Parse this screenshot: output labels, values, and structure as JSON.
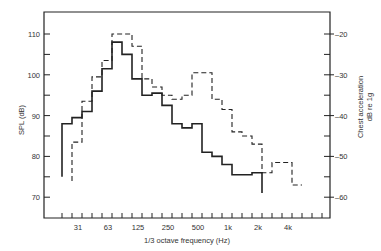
{
  "chart_data": {
    "type": "line",
    "subtype": "step",
    "title": "",
    "xlabel": "1/3 octave frequency (Hz)",
    "ylabel": "SPL (dB)",
    "y2label_line1": "Chest acceleration",
    "y2label_line2": "dB re 1g",
    "x_tick_labels": [
      "31",
      "63",
      "125",
      "250",
      "500",
      "1k",
      "2k",
      "4k"
    ],
    "y_ticks": [
      70,
      80,
      90,
      100,
      110
    ],
    "y2_ticks": [
      -20,
      -30,
      -40,
      -50,
      -60
    ],
    "ylim": [
      65,
      115
    ],
    "y2lim": [
      -65,
      -15
    ],
    "grid": false,
    "legend": "none",
    "bands": [
      "20",
      "25",
      "31.5",
      "40",
      "50",
      "63",
      "80",
      "100",
      "125",
      "160",
      "200",
      "250",
      "315",
      "400",
      "500",
      "630",
      "800",
      "1k",
      "1.25k",
      "1.6k",
      "2k",
      "2.5k",
      "3.15k"
    ],
    "series": [
      {
        "name": "SPL (dB)",
        "style": "solid",
        "axis": "left",
        "start_band_index": 0,
        "values": [
          88,
          89.5,
          91,
          96,
          101.5,
          108,
          105,
          99,
          95,
          95.5,
          92.5,
          88,
          87,
          88,
          81,
          80,
          78,
          75.5,
          75.5,
          76
        ],
        "start_drop_to": 75,
        "end_drop_to": 71
      },
      {
        "name": "Chest acceleration (dB re 1g)",
        "style": "dashed",
        "axis": "right",
        "start_band_index": 1,
        "values": [
          -46.5,
          -36.5,
          -30.5,
          -26.5,
          -20,
          -20,
          -23,
          -31,
          -33,
          -35,
          -36,
          -35,
          -29.5,
          -29.5,
          -36,
          -38.5,
          -44,
          -45,
          -47,
          -54,
          -51.5,
          -51.5,
          -57
        ],
        "note": "right-axis values; read from dashed step trace"
      }
    ]
  },
  "axes": {
    "x_title": "1/3 octave frequency (Hz)",
    "left_title": "SPL (dB)",
    "right_title_1": "Chest acceleration",
    "right_title_2": "dB re 1g"
  }
}
